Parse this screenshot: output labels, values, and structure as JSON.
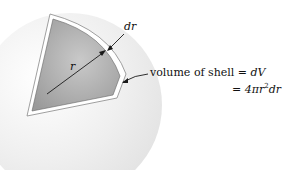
{
  "diagram": {
    "labels": {
      "dr": "dr",
      "r": "r",
      "shell_text": "volume of shell",
      "eq1_sign": "=",
      "eq1_rhs": "dV",
      "eq2_sign": "=",
      "eq2_coef": "4π",
      "eq2_r": "r",
      "eq2_exp": "2",
      "eq2_dr": "dr"
    },
    "colors": {
      "sphere": "#e9e9e9",
      "wedge_fill": "#a9a9a9",
      "shell": "#ffffff",
      "line": "#1a1a1a"
    }
  }
}
